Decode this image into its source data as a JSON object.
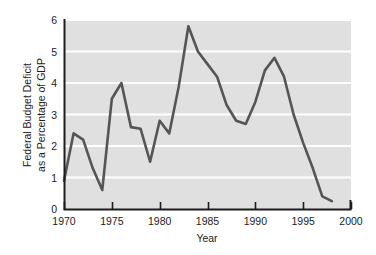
{
  "chart_data": {
    "type": "line",
    "title": "",
    "xlabel": "Year",
    "ylabel": "Federal Budget Deficit as a Percentage of GDP",
    "ylabel_line1": "Federal Budget Deficit",
    "ylabel_line2": "as a Percentage of GDP",
    "xlim": [
      1970,
      2000
    ],
    "ylim": [
      0,
      6
    ],
    "xticks": [
      1970,
      1975,
      1980,
      1985,
      1990,
      1995,
      2000
    ],
    "xtick_labels": [
      "1970",
      "1975",
      "1980",
      "1985",
      "1990",
      "1995",
      "2000"
    ],
    "yticks": [
      0,
      1,
      2,
      3,
      4,
      5,
      6
    ],
    "ytick_labels": [
      "0",
      "1",
      "2",
      "3",
      "4",
      "5",
      "6"
    ],
    "grid": "horizontal-white-lines",
    "legend": "none",
    "plot_background_color": "#e0e0e0",
    "gridline_color": "#ffffff",
    "line_color": "#555555",
    "axis_color": "#1c1c1c",
    "series": [
      {
        "name": "Federal Budget Deficit as a Percentage of GDP",
        "x": [
          1970,
          1971,
          1972,
          1973,
          1974,
          1975,
          1976,
          1977,
          1978,
          1979,
          1980,
          1981,
          1982,
          1983,
          1984,
          1985,
          1986,
          1987,
          1988,
          1989,
          1990,
          1991,
          1992,
          1993,
          1994,
          1995,
          1996,
          1997,
          1998
        ],
        "values": [
          0.9,
          2.4,
          2.2,
          1.3,
          0.6,
          3.5,
          4.0,
          2.6,
          2.55,
          1.5,
          2.8,
          2.4,
          3.9,
          5.8,
          5.0,
          4.6,
          4.2,
          3.3,
          2.8,
          2.7,
          3.4,
          4.4,
          4.8,
          4.2,
          3.0,
          2.1,
          1.3,
          0.4,
          0.25
        ]
      }
    ]
  }
}
